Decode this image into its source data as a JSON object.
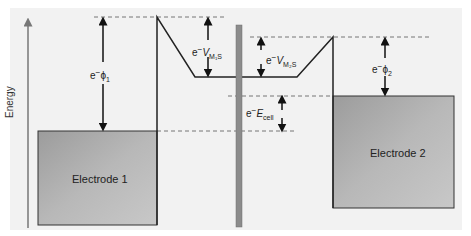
{
  "diagram": {
    "axis_label": "Energy",
    "electrode_1": {
      "label": "Electrode 1",
      "fill": "#a6a6a6"
    },
    "electrode_2": {
      "label": "Electrode 2",
      "fill": "#a6a6a6"
    },
    "labels": {
      "phi1_prefix": "e",
      "phi1_sup": "−",
      "phi1_sym": "ϕ",
      "phi1_sub": "1",
      "phi2_prefix": "e",
      "phi2_sup": "−",
      "phi2_sym": "ϕ",
      "phi2_sub": "2",
      "vm1s_prefix": "e",
      "vm1s_sup": "−",
      "vm1s_sym": "V",
      "vm1s_sub": "M₁S",
      "vm2s_prefix": "e",
      "vm2s_sup": "−",
      "vm2s_sym": "V",
      "vm2s_sub": "M₂S",
      "ecell_prefix": "e",
      "ecell_sup": "−",
      "ecell_sym": "E",
      "ecell_sub": "cell"
    },
    "colors": {
      "background": "#f2f2f2",
      "line": "#222222",
      "barrier": "#8c8c8c",
      "dash": "#555555"
    }
  }
}
